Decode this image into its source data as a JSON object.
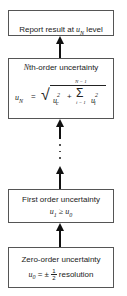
{
  "diagram": {
    "boxes": [
      {
        "id": "report",
        "label_prefix": "Report result at ",
        "label_var": "u",
        "label_sub": "N",
        "label_suffix": " level"
      },
      {
        "id": "nth-order",
        "title_var": "N",
        "title_rest": "th-order uncertainty",
        "formula": {
          "lhs": "u",
          "lhs_sub": "N",
          "eq": " = ",
          "sqrt_symbol": "√",
          "term1": "u",
          "term1_sub": "c",
          "term1_sup": "2",
          "plus": " + ",
          "sum_symbol": "Σ",
          "sum_upper": "N − 1",
          "sum_lower": "i = 1",
          "term2": "u",
          "term2_sub": "i",
          "term2_sup": "2"
        }
      },
      {
        "id": "first-order",
        "title": "First order uncertainty",
        "formula": {
          "lhs": "u",
          "lhs_sub": "1",
          "op": " ≥ ",
          "rhs": "u",
          "rhs_sub": "0"
        }
      },
      {
        "id": "zero-order",
        "title": "Zero-order uncertainty",
        "formula": {
          "lhs": "u",
          "lhs_sub": "0",
          "eq": " = ± ",
          "frac_num": "1",
          "frac_den": "2",
          "rest": " resolution"
        }
      }
    ]
  }
}
